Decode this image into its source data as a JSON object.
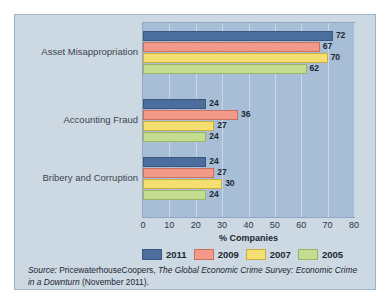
{
  "chart_data": {
    "type": "bar",
    "orientation": "horizontal",
    "title": "",
    "xlabel": "% Companies",
    "ylabel": "",
    "xlim": [
      0,
      80
    ],
    "xticks": [
      0,
      10,
      20,
      30,
      40,
      50,
      60,
      70,
      80
    ],
    "grid": true,
    "legend_position": "bottom",
    "categories": [
      "Asset Misappropriation",
      "Accounting Fraud",
      "Bribery and Corruption"
    ],
    "series": [
      {
        "name": "2011",
        "color": "#4c6e9e",
        "values": [
          72,
          24,
          24
        ]
      },
      {
        "name": "2009",
        "color": "#f2998a",
        "values": [
          67,
          36,
          27
        ]
      },
      {
        "name": "2007",
        "color": "#f6df72",
        "values": [
          70,
          27,
          30
        ]
      },
      {
        "name": "2005",
        "color": "#c2dc90",
        "values": [
          62,
          24,
          24
        ]
      }
    ]
  },
  "legend": {
    "items": [
      {
        "label": "2011",
        "swatch": "s2011"
      },
      {
        "label": "2009",
        "swatch": "s2009"
      },
      {
        "label": "2007",
        "swatch": "s2007"
      },
      {
        "label": "2005",
        "swatch": "s2005"
      }
    ]
  },
  "source": {
    "prefix": "Source:",
    "publisher": "PricewaterhouseCoopers,",
    "title": "The Global Economic Crime Survey: Economic Crime in a Downturn",
    "suffix": "(November 2011)."
  },
  "colors": {
    "panel_background": "#ccd8e2",
    "plot_background": "#a8bdd6",
    "gridline": "#c9d8e8",
    "panel_border": "#9fb4c6"
  }
}
